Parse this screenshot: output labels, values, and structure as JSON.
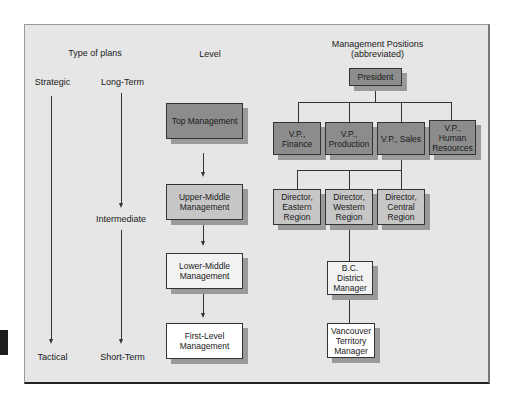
{
  "headers": {
    "type_of_plans": "Type of plans",
    "level": "Level",
    "management_positions": "Management Positions (abbreviated)"
  },
  "plan_types": {
    "strategic": "Strategic",
    "tactical": "Tactical",
    "long_term": "Long-Term",
    "intermediate": "Intermediate",
    "short_term": "Short-Term"
  },
  "levels": [
    {
      "label": "Top Management"
    },
    {
      "label": "Upper-Middle Management"
    },
    {
      "label": "Lower-Middle Management"
    },
    {
      "label": "First-Level Management"
    }
  ],
  "positions": {
    "president": "President",
    "vps": [
      {
        "label": "V.P., Finance"
      },
      {
        "label": "V.P., Production"
      },
      {
        "label": "V.P., Sales"
      },
      {
        "label": "V.P., Human Resources"
      }
    ],
    "directors": [
      {
        "label": "Director, Eastern Region"
      },
      {
        "label": "Director, Western Region"
      },
      {
        "label": "Director, Central Region"
      }
    ],
    "district_manager": "B.C. District Manager",
    "territory_manager": "Vancouver Territory Manager"
  },
  "colors": {
    "frame_bg": "#e6e6e6",
    "top_level": "#8c8c8c",
    "upper_middle": "#c6c6c6",
    "lower_middle": "#f2f2f2",
    "first_level": "#ffffff"
  }
}
